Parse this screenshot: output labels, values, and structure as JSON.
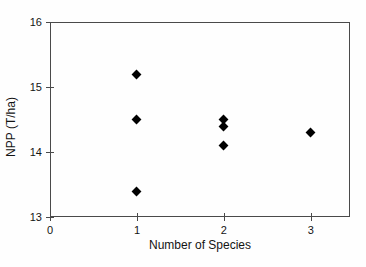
{
  "chart_data": {
    "type": "scatter",
    "title": "",
    "xlabel": "Number of Species",
    "ylabel": "NPP (T/ha)",
    "xlim": [
      0,
      3.45
    ],
    "ylim": [
      13,
      16
    ],
    "x_ticks": [
      0,
      1,
      2,
      3
    ],
    "y_ticks": [
      13,
      14,
      15,
      16
    ],
    "grid": false,
    "legend": null,
    "marker": "diamond",
    "marker_color": "#000000",
    "frame_color": "#4a4a4a",
    "points": [
      {
        "x": 1,
        "y": 15.2
      },
      {
        "x": 1,
        "y": 14.5
      },
      {
        "x": 1,
        "y": 13.4
      },
      {
        "x": 2,
        "y": 14.5
      },
      {
        "x": 2,
        "y": 14.4
      },
      {
        "x": 2,
        "y": 14.1
      },
      {
        "x": 3,
        "y": 14.3
      }
    ]
  }
}
